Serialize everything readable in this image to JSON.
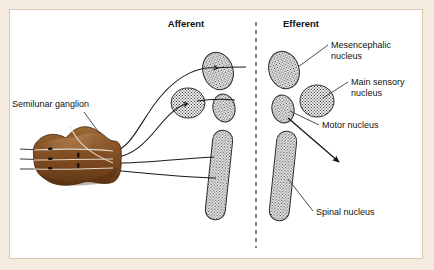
{
  "figure": {
    "background_color": "#f4ece1",
    "panel_color": "#ffffff",
    "border_color": "#d9c9b0",
    "headings": [
      {
        "id": "afferent",
        "label": "Afferent",
        "x": 186,
        "y": 27
      },
      {
        "id": "efferent",
        "label": "Efferent",
        "x": 283,
        "y": 27
      }
    ],
    "divider": {
      "name": "afferent-efferent-divider",
      "x": 256,
      "y_top": 22,
      "y_bottom": 248,
      "style": "dashed",
      "color": "#555555"
    },
    "labels": [
      {
        "id": "semilunar-ganglion",
        "text": "Semilunar ganglion",
        "x": 12,
        "y": 107,
        "anchor": "start",
        "leader": [
          [
            84,
            112
          ],
          [
            101,
            133
          ]
        ]
      },
      {
        "id": "mesencephalic-nucleus",
        "text": "Mesencephalic",
        "text2": "nucleus",
        "x": 331,
        "y": 48,
        "anchor": "start",
        "leader": [
          [
            327,
            46
          ],
          [
            298,
            68
          ]
        ]
      },
      {
        "id": "main-sensory-nucleus",
        "text": "Main sensory",
        "text2": "nucleus",
        "x": 351,
        "y": 85,
        "anchor": "start",
        "leader": [
          [
            347,
            83
          ],
          [
            321,
            99
          ]
        ]
      },
      {
        "id": "motor-nucleus",
        "text": "Motor nucleus",
        "text2": "",
        "x": 322,
        "y": 128,
        "anchor": "start",
        "leader": [
          [
            318,
            125
          ],
          [
            289,
            110
          ]
        ]
      },
      {
        "id": "spinal-nucleus",
        "text": "Spinal nucleus",
        "text2": "",
        "x": 316,
        "y": 215,
        "anchor": "start",
        "leader": [
          [
            312,
            211
          ],
          [
            288,
            180
          ]
        ]
      }
    ],
    "ganglion": {
      "name": "semilunar-ganglion-body",
      "fill_dark": "#6b3f1d",
      "fill_mid": "#8a5526",
      "fill_light": "#a9723a",
      "cx": 82,
      "cy": 158
    },
    "nuclei": [
      {
        "id": "afferent-mesencephalic",
        "side": "afferent",
        "shape": "ellipse",
        "cx": 218,
        "cy": 71,
        "rx": 15,
        "ry": 19,
        "rotate": -18
      },
      {
        "id": "afferent-main-sensory",
        "side": "afferent",
        "shape": "ellipse",
        "cx": 188,
        "cy": 103,
        "rx": 17,
        "ry": 15,
        "rotate": 0
      },
      {
        "id": "afferent-small-nucleus",
        "side": "afferent",
        "shape": "ellipse",
        "cx": 224,
        "cy": 108,
        "rx": 11,
        "ry": 14,
        "rotate": -12
      },
      {
        "id": "afferent-spinal",
        "side": "afferent",
        "shape": "elongated",
        "cx": 219,
        "cy": 175,
        "rx": 10,
        "ry": 45,
        "rotate": 6
      },
      {
        "id": "efferent-mesencephalic",
        "side": "efferent",
        "shape": "ellipse",
        "cx": 284,
        "cy": 70,
        "rx": 15,
        "ry": 19,
        "rotate": -18
      },
      {
        "id": "efferent-main-sensory",
        "side": "efferent",
        "shape": "ellipse",
        "cx": 317,
        "cy": 101,
        "rx": 17,
        "ry": 16,
        "rotate": 0
      },
      {
        "id": "efferent-motor",
        "side": "efferent",
        "shape": "ellipse",
        "cx": 283,
        "cy": 109,
        "rx": 11,
        "ry": 14,
        "rotate": -12
      },
      {
        "id": "efferent-spinal",
        "side": "efferent",
        "shape": "elongated",
        "cx": 283,
        "cy": 176,
        "rx": 10,
        "ry": 45,
        "rotate": 6
      }
    ],
    "arrow": {
      "name": "efferent-motor-arrow",
      "from": [
        288,
        119
      ],
      "to": [
        340,
        163
      ]
    },
    "fibers_afferent": [
      {
        "id": "fiber-to-mesencephalic",
        "path": "M112,152 C130,150 140,120 160,95 C178,74 198,66 214,68"
      },
      {
        "id": "fiber-to-main-sensory",
        "path": "M112,158 C132,157 146,140 160,124 C170,112 178,106 186,104"
      },
      {
        "id": "fiber-to-spinal-upper",
        "path": "M112,163 C140,163 170,159 200,157"
      },
      {
        "id": "fiber-to-spinal-lower",
        "path": "M112,170 C142,172 175,176 206,177"
      }
    ],
    "nerve_roots": [
      {
        "id": "root-1",
        "y": 151
      },
      {
        "id": "root-2",
        "y": 160
      },
      {
        "id": "root-3",
        "y": 169
      }
    ]
  }
}
